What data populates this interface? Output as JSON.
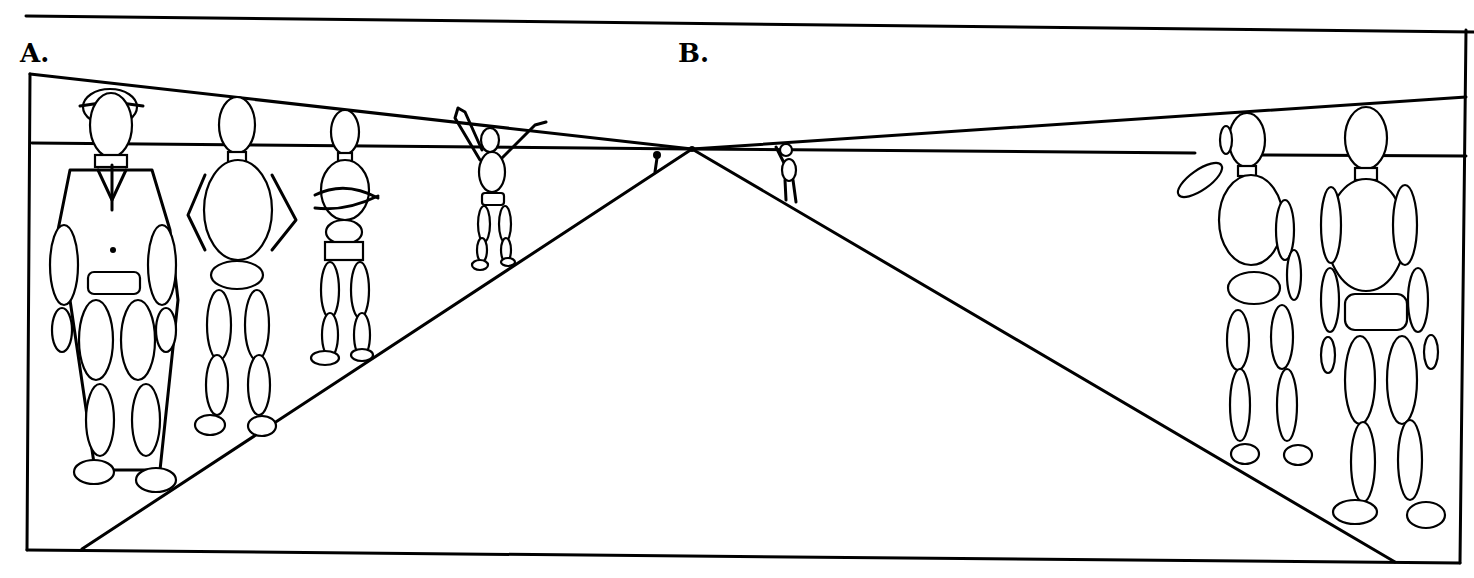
{
  "diagram": {
    "type": "one-point perspective figure drawing",
    "labels": {
      "a": "A.",
      "b": "B."
    },
    "colors": {
      "ink": "#000000",
      "paper": "#ffffff"
    },
    "elements": {
      "horizon_line": "horizontal line at eye level",
      "vanishing_point": "center where converging lines meet",
      "group_a": [
        "man in suit with hat",
        "figure hands on hips",
        "figure arms crossed",
        "figure arms raised",
        "tiny distant figure"
      ],
      "group_b": [
        "small distant figure",
        "figure saluting",
        "standing mannequin figure"
      ]
    }
  }
}
